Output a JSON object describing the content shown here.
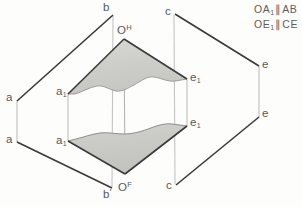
{
  "figure": {
    "colors": {
      "stroke_dark": "#3a3a3c",
      "stroke_light": "#b9b9bb",
      "shade_fill": "#cfcfcb",
      "label_color": "#58585a",
      "background": "#fdfdfc"
    },
    "notes": [
      {
        "id": "note-oa1-ab",
        "lhs": "OA",
        "lhs_sub": "1",
        "symbol": "∥",
        "rhs": "AB"
      },
      {
        "id": "note-oe1-ce",
        "lhs": "OE",
        "lhs_sub": "1",
        "symbol": "∥",
        "rhs": "CE"
      }
    ],
    "labels": [
      {
        "id": "label-b-top",
        "text": "b",
        "sub": "",
        "sup": "",
        "prime": "",
        "x": 103,
        "y": 2
      },
      {
        "id": "label-c-top",
        "text": "c",
        "sub": "",
        "sup": "",
        "prime": "",
        "x": 165,
        "y": 6
      },
      {
        "id": "label-o-h",
        "text": "O",
        "sub": "",
        "sup": "H",
        "prime": "",
        "x": 117,
        "y": 24
      },
      {
        "id": "label-a-upper",
        "text": "a",
        "sub": "",
        "sup": "",
        "prime": "",
        "x": 6,
        "y": 92
      },
      {
        "id": "label-a1-upper",
        "text": "a",
        "sub": "1",
        "sup": "",
        "prime": "",
        "x": 56,
        "y": 86
      },
      {
        "id": "label-e1-upper",
        "text": "e",
        "sub": "1",
        "sup": "",
        "prime": "",
        "x": 190,
        "y": 72
      },
      {
        "id": "label-e-upper",
        "text": "e",
        "sub": "",
        "sup": "",
        "prime": "",
        "x": 262,
        "y": 59
      },
      {
        "id": "label-a-lower",
        "text": "a",
        "sub": "",
        "sup": "",
        "prime": "",
        "x": 6,
        "y": 134
      },
      {
        "id": "label-a1-lower",
        "text": "a",
        "sub": "1",
        "sup": "",
        "prime": "",
        "x": 56,
        "y": 135
      },
      {
        "id": "label-e1-lower",
        "text": "e",
        "sub": "1",
        "sup": "",
        "prime": "",
        "x": 190,
        "y": 117
      },
      {
        "id": "label-e-lower",
        "text": "e",
        "sub": "",
        "sup": "",
        "prime": "",
        "x": 262,
        "y": 108
      },
      {
        "id": "label-o-f",
        "text": "O",
        "sub": "",
        "sup": "F",
        "prime": "",
        "x": 118,
        "y": 181
      },
      {
        "id": "label-b-prime",
        "text": "b",
        "sub": "",
        "sup": "",
        "prime": "'",
        "x": 103,
        "y": 188
      },
      {
        "id": "label-c-bottom",
        "text": "c",
        "sub": "",
        "sup": "",
        "prime": "",
        "x": 166,
        "y": 180
      }
    ],
    "geometry": {
      "points": {
        "b_top": [
          113,
          14
        ],
        "c_top": [
          174,
          13
        ],
        "o_h": [
          124,
          39
        ],
        "a_upper": [
          17,
          101
        ],
        "a1_upper": [
          68,
          94
        ],
        "e1_upper": [
          187,
          79
        ],
        "e_upper": [
          259,
          66
        ],
        "a_lower": [
          17,
          142
        ],
        "a1_lower": [
          68,
          141
        ],
        "e1_lower": [
          187,
          126
        ],
        "e_lower": [
          259,
          117
        ],
        "o_f": [
          125,
          174
        ],
        "b_prime": [
          112,
          189
        ],
        "c_bottom": [
          175,
          186
        ]
      },
      "dark_edges": [
        [
          "a_upper",
          "b_top"
        ],
        [
          "c_top",
          "e_upper"
        ],
        [
          "a_lower",
          "b_prime"
        ],
        [
          "c_bottom",
          "e_lower"
        ],
        [
          "a1_upper",
          "o_h"
        ],
        [
          "o_h",
          "e1_upper"
        ],
        [
          "a1_lower",
          "o_f"
        ],
        [
          "o_f",
          "e1_lower"
        ]
      ],
      "light_connectors": [
        [
          "a_upper",
          "a_lower"
        ],
        [
          "a1_upper",
          "a1_lower"
        ],
        [
          "e1_upper",
          "e1_lower"
        ],
        [
          "e_upper",
          "e_lower"
        ],
        [
          "b_top",
          "b_prime"
        ],
        [
          "c_top",
          "c_bottom"
        ]
      ],
      "shaded_regions": [
        {
          "id": "upper-shaded-face",
          "apex": "o_h",
          "left": "a1_upper",
          "right": "e1_upper",
          "wavy_edge": "bottom"
        },
        {
          "id": "lower-shaded-face",
          "apex": "o_f",
          "left": "a1_lower",
          "right": "e1_lower",
          "wavy_edge": "top"
        }
      ]
    }
  }
}
